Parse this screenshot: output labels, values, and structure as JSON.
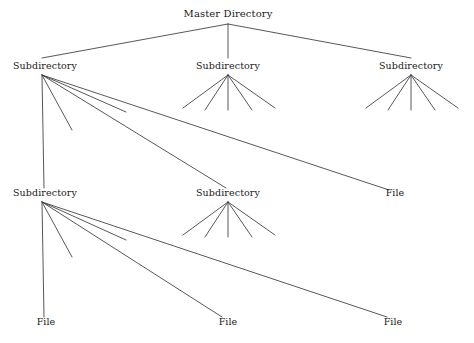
{
  "diagram": {
    "type": "tree",
    "background_color": "#ffffff",
    "line_color": "#3a3a3a",
    "text_color": "#1a1a1a",
    "labels": {
      "master_directory": "Master Directory",
      "subdirectory": "Subdirectory",
      "file": "File"
    },
    "nodes": [
      {
        "id": "root",
        "label": "Master Directory",
        "kind": "directory",
        "x": 228,
        "y": 20,
        "anchor_x": 228,
        "anchor_y": 24,
        "level": 0
      },
      {
        "id": "s1",
        "label": "Subdirectory",
        "kind": "directory",
        "x": 45,
        "y": 72,
        "anchor_x": 42,
        "anchor_y": 75,
        "level": 1
      },
      {
        "id": "s2",
        "label": "Subdirectory",
        "kind": "directory",
        "x": 228,
        "y": 72,
        "anchor_x": 228,
        "anchor_y": 75,
        "level": 1
      },
      {
        "id": "s3",
        "label": "Subdirectory",
        "kind": "directory",
        "x": 411,
        "y": 72,
        "anchor_x": 411,
        "anchor_y": 75,
        "level": 1
      },
      {
        "id": "s4",
        "label": "Subdirectory",
        "kind": "directory",
        "x": 45,
        "y": 199,
        "anchor_x": 42,
        "anchor_y": 202,
        "level": 2
      },
      {
        "id": "s5",
        "label": "Subdirectory",
        "kind": "directory",
        "x": 228,
        "y": 199,
        "anchor_x": 228,
        "anchor_y": 202,
        "level": 2
      },
      {
        "id": "f1",
        "label": "File",
        "kind": "file",
        "x": 395,
        "y": 199,
        "anchor_x": 389,
        "anchor_y": 190,
        "level": 2
      },
      {
        "id": "f2",
        "label": "File",
        "kind": "file",
        "x": 46,
        "y": 328,
        "anchor_x": 44,
        "anchor_y": 318,
        "level": 3
      },
      {
        "id": "f3",
        "label": "File",
        "kind": "file",
        "x": 228,
        "y": 328,
        "anchor_x": 222,
        "anchor_y": 318,
        "level": 3
      },
      {
        "id": "f4",
        "label": "File",
        "kind": "file",
        "x": 393,
        "y": 328,
        "anchor_x": 387,
        "anchor_y": 318,
        "level": 3
      }
    ],
    "edges": [
      {
        "from": "root",
        "to": "s1",
        "x1": 228,
        "y1": 24,
        "x2": 42,
        "y2": 58
      },
      {
        "from": "root",
        "to": "s2",
        "x1": 228,
        "y1": 24,
        "x2": 228,
        "y2": 58
      },
      {
        "from": "root",
        "to": "s3",
        "x1": 228,
        "y1": 24,
        "x2": 411,
        "y2": 58
      },
      {
        "from": "s1",
        "to": "s4",
        "x1": 42,
        "y1": 75,
        "x2": 44,
        "y2": 188
      },
      {
        "from": "s1",
        "to": null,
        "x1": 42,
        "y1": 75,
        "x2": 72,
        "y2": 130
      },
      {
        "from": "s1",
        "to": null,
        "x1": 42,
        "y1": 75,
        "x2": 126,
        "y2": 112
      },
      {
        "from": "s1",
        "to": "s5",
        "x1": 42,
        "y1": 75,
        "x2": 226,
        "y2": 188
      },
      {
        "from": "s1",
        "to": "f1",
        "x1": 42,
        "y1": 75,
        "x2": 389,
        "y2": 190
      },
      {
        "from": "s2",
        "to": null,
        "x1": 228,
        "y1": 75,
        "x2": 183,
        "y2": 108
      },
      {
        "from": "s2",
        "to": null,
        "x1": 228,
        "y1": 75,
        "x2": 205,
        "y2": 110
      },
      {
        "from": "s2",
        "to": null,
        "x1": 228,
        "y1": 75,
        "x2": 228,
        "y2": 110
      },
      {
        "from": "s2",
        "to": null,
        "x1": 228,
        "y1": 75,
        "x2": 252,
        "y2": 110
      },
      {
        "from": "s2",
        "to": null,
        "x1": 228,
        "y1": 75,
        "x2": 275,
        "y2": 108
      },
      {
        "from": "s3",
        "to": null,
        "x1": 411,
        "y1": 75,
        "x2": 366,
        "y2": 108
      },
      {
        "from": "s3",
        "to": null,
        "x1": 411,
        "y1": 75,
        "x2": 388,
        "y2": 110
      },
      {
        "from": "s3",
        "to": null,
        "x1": 411,
        "y1": 75,
        "x2": 411,
        "y2": 110
      },
      {
        "from": "s3",
        "to": null,
        "x1": 411,
        "y1": 75,
        "x2": 435,
        "y2": 110
      },
      {
        "from": "s3",
        "to": null,
        "x1": 411,
        "y1": 75,
        "x2": 458,
        "y2": 108
      },
      {
        "from": "s4",
        "to": "f2",
        "x1": 42,
        "y1": 202,
        "x2": 44,
        "y2": 317
      },
      {
        "from": "s4",
        "to": null,
        "x1": 42,
        "y1": 202,
        "x2": 72,
        "y2": 257
      },
      {
        "from": "s4",
        "to": null,
        "x1": 42,
        "y1": 202,
        "x2": 126,
        "y2": 240
      },
      {
        "from": "s4",
        "to": "f3",
        "x1": 42,
        "y1": 202,
        "x2": 222,
        "y2": 317
      },
      {
        "from": "s4",
        "to": "f4",
        "x1": 42,
        "y1": 202,
        "x2": 387,
        "y2": 317
      },
      {
        "from": "s5",
        "to": null,
        "x1": 228,
        "y1": 202,
        "x2": 183,
        "y2": 235
      },
      {
        "from": "s5",
        "to": null,
        "x1": 228,
        "y1": 202,
        "x2": 205,
        "y2": 237
      },
      {
        "from": "s5",
        "to": null,
        "x1": 228,
        "y1": 202,
        "x2": 228,
        "y2": 237
      },
      {
        "from": "s5",
        "to": null,
        "x1": 228,
        "y1": 202,
        "x2": 252,
        "y2": 237
      },
      {
        "from": "s5",
        "to": null,
        "x1": 228,
        "y1": 202,
        "x2": 275,
        "y2": 235
      }
    ]
  }
}
